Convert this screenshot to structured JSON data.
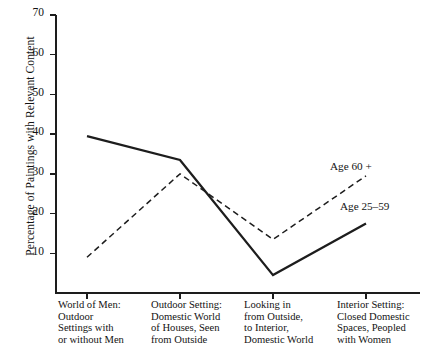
{
  "chart_data": {
    "type": "line",
    "title": "",
    "xlabel": "",
    "ylabel": "Percentage of Paintings with Relevant Content",
    "ylim": [
      0,
      70
    ],
    "yticks": [
      10,
      20,
      30,
      40,
      50,
      60,
      70
    ],
    "grid": false,
    "legend_position": "inline-right",
    "categories": [
      "World of Men: Outdoor Settings with or without Men",
      "Outdoor Setting: Domestic World of Houses, Seen from Outside",
      "Looking in from Outside, to Interior, Domestic World",
      "Interior Setting: Closed Domestic Spaces, Peopled with Women"
    ],
    "category_lines": [
      [
        "World of Men:",
        "Outdoor",
        "Settings with",
        "or without Men"
      ],
      [
        "Outdoor Setting:",
        "Domestic World",
        "of Houses, Seen",
        "from Outside"
      ],
      [
        "Looking in",
        "from Outside,",
        "to Interior,",
        "Domestic World"
      ],
      [
        "Interior Setting:",
        "Closed Domestic",
        "Spaces, Peopled",
        "with Women"
      ]
    ],
    "series": [
      {
        "name": "Age 25-59",
        "label": "Age 25–59",
        "style": "solid",
        "color": "#1d1d1d",
        "values": [
          39.5,
          33.5,
          4.5,
          17.5
        ]
      },
      {
        "name": "Age 60 +",
        "label": "Age 60 +",
        "style": "dashed",
        "color": "#1d1d1d",
        "values": [
          9,
          30,
          13.5,
          29.5
        ]
      }
    ]
  }
}
